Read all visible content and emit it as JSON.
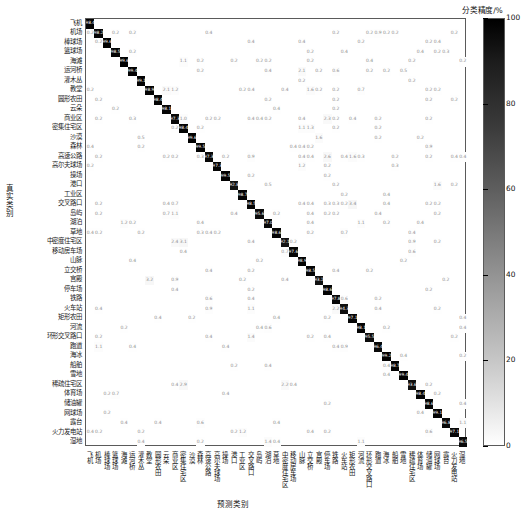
{
  "colorbar": {
    "title": "分类精度/%",
    "ticks": [
      100,
      80,
      60,
      40,
      20,
      0
    ],
    "min": 0,
    "max": 100,
    "colormap": "grayscale-inverted",
    "color_high": "#000000",
    "color_low": "#ffffff"
  },
  "axes": {
    "xlabel": "预测类别",
    "ylabel": "真实类别"
  },
  "chart_data": {
    "type": "heatmap",
    "title": "",
    "xlabel": "预测类别",
    "ylabel": "真实类别",
    "zlabel": "分类精度/%",
    "zlim": [
      0,
      100
    ],
    "grid": false,
    "legend": "colorbar-right",
    "categories": [
      "飞机",
      "机场",
      "棒球场",
      "篮球场",
      "海滩",
      "运河桥",
      "灌木丛",
      "教堂",
      "圆形农田",
      "云朵",
      "商业区",
      "密集住宅区",
      "沙漠",
      "森林",
      "高速公路",
      "高尔夫球场",
      "操场",
      "港口",
      "工业区",
      "交叉路口",
      "岛屿",
      "湖泊",
      "草地",
      "中密度住宅区",
      "移动房车场",
      "山脉",
      "立交桥",
      "宫殿",
      "停车场",
      "铁路",
      "火车站",
      "矩形农田",
      "河流",
      "环形交叉路口",
      "跑道",
      "海冰",
      "船舶",
      "雪地",
      "稀疏住宅区",
      "体育场",
      "储油罐",
      "网球场",
      "露台",
      "火力发电站",
      "湿地"
    ],
    "diagonal": [
      98.4,
      98.2,
      99.6,
      98.5,
      99.6,
      99.4,
      99.1,
      98.9,
      98.4,
      98.1,
      97.3,
      98.4,
      99.6,
      99.5,
      97.3,
      97.3,
      99.5,
      92.8,
      98.7,
      98.5,
      95.6,
      97.0,
      98.6,
      92.1,
      97.6,
      98.9,
      98.5,
      93.2,
      98.6,
      97.8,
      94.3,
      97.1,
      98.1,
      95.5,
      96.4,
      99.2,
      98.7,
      99.4,
      93.6,
      98.4,
      98.6,
      99.1,
      96.8,
      97.1,
      96.5
    ],
    "offdiagonal": [
      {
        "r": 1,
        "c": 0,
        "v": 0.2
      },
      {
        "r": 1,
        "c": 3,
        "v": 0.2
      },
      {
        "r": 1,
        "c": 5,
        "v": 0.2
      },
      {
        "r": 1,
        "c": 14,
        "v": 0.4
      },
      {
        "r": 1,
        "c": 29,
        "v": 0.2
      },
      {
        "r": 1,
        "c": 33,
        "v": 0.2
      },
      {
        "r": 1,
        "c": 34,
        "v": 0.9
      },
      {
        "r": 1,
        "c": 35,
        "v": 0.2
      },
      {
        "r": 1,
        "c": 36,
        "v": 0.2
      },
      {
        "r": 1,
        "c": 43,
        "v": 0.2
      },
      {
        "r": 2,
        "c": 1,
        "v": 0.2
      },
      {
        "r": 2,
        "c": 19,
        "v": 0.4
      },
      {
        "r": 2,
        "c": 25,
        "v": 0.4
      },
      {
        "r": 2,
        "c": 32,
        "v": 0.2
      },
      {
        "r": 2,
        "c": 40,
        "v": 0.2
      },
      {
        "r": 2,
        "c": 41,
        "v": 0.4
      },
      {
        "r": 3,
        "c": 5,
        "v": 0.2
      },
      {
        "r": 3,
        "c": 26,
        "v": 0.2
      },
      {
        "r": 3,
        "c": 30,
        "v": 0.4
      },
      {
        "r": 3,
        "c": 39,
        "v": 0.4
      },
      {
        "r": 3,
        "c": 41,
        "v": 0.2
      },
      {
        "r": 3,
        "c": 42,
        "v": 0.3
      },
      {
        "r": 4,
        "c": 11,
        "v": 1.1
      },
      {
        "r": 4,
        "c": 13,
        "v": 0.2
      },
      {
        "r": 4,
        "c": 17,
        "v": 0.2
      },
      {
        "r": 4,
        "c": 20,
        "v": 0.2
      },
      {
        "r": 4,
        "c": 21,
        "v": 0.2
      },
      {
        "r": 4,
        "c": 26,
        "v": 0.2
      },
      {
        "r": 4,
        "c": 33,
        "v": 0.4
      },
      {
        "r": 4,
        "c": 38,
        "v": 0.2
      },
      {
        "r": 4,
        "c": 44,
        "v": 0.2
      },
      {
        "r": 5,
        "c": 13,
        "v": 0.2
      },
      {
        "r": 5,
        "c": 21,
        "v": 0.4
      },
      {
        "r": 5,
        "c": 25,
        "v": 2.1
      },
      {
        "r": 5,
        "c": 27,
        "v": 0.2
      },
      {
        "r": 5,
        "c": 29,
        "v": 0.6
      },
      {
        "r": 5,
        "c": 33,
        "v": 0.2
      },
      {
        "r": 5,
        "c": 35,
        "v": 0.2
      },
      {
        "r": 5,
        "c": 37,
        "v": 0.5
      },
      {
        "r": 6,
        "c": 25,
        "v": 0.2
      },
      {
        "r": 6,
        "c": 38,
        "v": 0.2
      },
      {
        "r": 7,
        "c": 0,
        "v": 0.2
      },
      {
        "r": 7,
        "c": 9,
        "v": 2.1
      },
      {
        "r": 7,
        "c": 10,
        "v": 1.2
      },
      {
        "r": 7,
        "c": 18,
        "v": 0.2
      },
      {
        "r": 7,
        "c": 19,
        "v": 0.4
      },
      {
        "r": 7,
        "c": 23,
        "v": 0.4
      },
      {
        "r": 7,
        "c": 26,
        "v": 1.6
      },
      {
        "r": 7,
        "c": 27,
        "v": 0.2
      },
      {
        "r": 7,
        "c": 29,
        "v": 0.2
      },
      {
        "r": 7,
        "c": 32,
        "v": 0.7
      },
      {
        "r": 7,
        "c": 40,
        "v": 0.2
      },
      {
        "r": 7,
        "c": 41,
        "v": 0.2
      },
      {
        "r": 8,
        "c": 1,
        "v": 0.2
      },
      {
        "r": 8,
        "c": 21,
        "v": 0.2
      },
      {
        "r": 8,
        "c": 29,
        "v": 0.2
      },
      {
        "r": 8,
        "c": 40,
        "v": 0.2
      },
      {
        "r": 8,
        "c": 43,
        "v": 0.2
      },
      {
        "r": 9,
        "c": 3,
        "v": 0.2
      },
      {
        "r": 9,
        "c": 22,
        "v": 0.4
      },
      {
        "r": 9,
        "c": 29,
        "v": 0.2
      },
      {
        "r": 10,
        "c": 1,
        "v": 0.2
      },
      {
        "r": 10,
        "c": 5,
        "v": 0.3
      },
      {
        "r": 10,
        "c": 11,
        "v": 1.0
      },
      {
        "r": 10,
        "c": 14,
        "v": 0.2
      },
      {
        "r": 10,
        "c": 15,
        "v": 0.2
      },
      {
        "r": 10,
        "c": 19,
        "v": 0.4
      },
      {
        "r": 10,
        "c": 20,
        "v": 0.4
      },
      {
        "r": 10,
        "c": 21,
        "v": 0.2
      },
      {
        "r": 10,
        "c": 25,
        "v": 0.4
      },
      {
        "r": 10,
        "c": 28,
        "v": 2.3
      },
      {
        "r": 10,
        "c": 29,
        "v": 0.2
      },
      {
        "r": 10,
        "c": 31,
        "v": 0.4
      },
      {
        "r": 10,
        "c": 34,
        "v": 0.2
      },
      {
        "r": 10,
        "c": 40,
        "v": 0.2
      },
      {
        "r": 11,
        "c": 10,
        "v": 0.2
      },
      {
        "r": 11,
        "c": 13,
        "v": 0.2
      },
      {
        "r": 11,
        "c": 25,
        "v": 1.1
      },
      {
        "r": 11,
        "c": 26,
        "v": 1.3
      },
      {
        "r": 11,
        "c": 29,
        "v": 0.2
      },
      {
        "r": 11,
        "c": 34,
        "v": 0.2
      },
      {
        "r": 12,
        "c": 6,
        "v": 0.5
      },
      {
        "r": 12,
        "c": 27,
        "v": 1.6
      },
      {
        "r": 12,
        "c": 34,
        "v": 0.2
      },
      {
        "r": 12,
        "c": 39,
        "v": 0.2
      },
      {
        "r": 13,
        "c": 0,
        "v": 0.4
      },
      {
        "r": 13,
        "c": 6,
        "v": 0.2
      },
      {
        "r": 13,
        "c": 24,
        "v": 0.4
      },
      {
        "r": 13,
        "c": 25,
        "v": 0.4
      },
      {
        "r": 13,
        "c": 26,
        "v": 0.2
      },
      {
        "r": 13,
        "c": 40,
        "v": 0.9
      },
      {
        "r": 14,
        "c": 1,
        "v": 0.2
      },
      {
        "r": 14,
        "c": 9,
        "v": 0.2
      },
      {
        "r": 14,
        "c": 10,
        "v": 0.2
      },
      {
        "r": 14,
        "c": 13,
        "v": 0.3
      },
      {
        "r": 14,
        "c": 16,
        "v": 0.2
      },
      {
        "r": 14,
        "c": 19,
        "v": 0.9
      },
      {
        "r": 14,
        "c": 25,
        "v": 0.4
      },
      {
        "r": 14,
        "c": 26,
        "v": 0.4
      },
      {
        "r": 14,
        "c": 28,
        "v": 2.6
      },
      {
        "r": 14,
        "c": 30,
        "v": 0.4
      },
      {
        "r": 14,
        "c": 31,
        "v": 1.6
      },
      {
        "r": 14,
        "c": 32,
        "v": 0.3
      },
      {
        "r": 14,
        "c": 36,
        "v": 0.2
      },
      {
        "r": 14,
        "c": 40,
        "v": 0.2
      },
      {
        "r": 14,
        "c": 43,
        "v": 0.4
      },
      {
        "r": 14,
        "c": 44,
        "v": 0.4
      },
      {
        "r": 15,
        "c": 0,
        "v": 0.2
      },
      {
        "r": 15,
        "c": 25,
        "v": 1.2
      },
      {
        "r": 15,
        "c": 28,
        "v": 0.2
      },
      {
        "r": 15,
        "c": 36,
        "v": 0.3
      },
      {
        "r": 16,
        "c": 19,
        "v": 0.2
      },
      {
        "r": 16,
        "c": 28,
        "v": 0.2
      },
      {
        "r": 17,
        "c": 21,
        "v": 0.5
      },
      {
        "r": 17,
        "c": 29,
        "v": 0.2
      },
      {
        "r": 17,
        "c": 41,
        "v": 1.6
      },
      {
        "r": 17,
        "c": 43,
        "v": 0.2
      },
      {
        "r": 18,
        "c": 30,
        "v": 0.2
      },
      {
        "r": 18,
        "c": 35,
        "v": 0.4
      },
      {
        "r": 19,
        "c": 1,
        "v": 0.2
      },
      {
        "r": 19,
        "c": 9,
        "v": 0.4
      },
      {
        "r": 19,
        "c": 10,
        "v": 0.7
      },
      {
        "r": 19,
        "c": 25,
        "v": 0.4
      },
      {
        "r": 19,
        "c": 26,
        "v": 0.4
      },
      {
        "r": 19,
        "c": 28,
        "v": 0.3
      },
      {
        "r": 19,
        "c": 29,
        "v": 0.3
      },
      {
        "r": 19,
        "c": 30,
        "v": 0.2
      },
      {
        "r": 19,
        "c": 31,
        "v": 3.4
      },
      {
        "r": 19,
        "c": 35,
        "v": 0.4
      },
      {
        "r": 19,
        "c": 40,
        "v": 0.2
      },
      {
        "r": 19,
        "c": 41,
        "v": 0.2
      },
      {
        "r": 20,
        "c": 1,
        "v": 0.2
      },
      {
        "r": 20,
        "c": 9,
        "v": 0.7
      },
      {
        "r": 20,
        "c": 10,
        "v": 1.1
      },
      {
        "r": 20,
        "c": 17,
        "v": 0.4
      },
      {
        "r": 20,
        "c": 22,
        "v": 0.2
      },
      {
        "r": 20,
        "c": 26,
        "v": 0.4
      },
      {
        "r": 20,
        "c": 28,
        "v": 0.2
      },
      {
        "r": 20,
        "c": 29,
        "v": 0.2
      },
      {
        "r": 20,
        "c": 34,
        "v": 0.4
      },
      {
        "r": 20,
        "c": 41,
        "v": 0.2
      },
      {
        "r": 21,
        "c": 4,
        "v": 1.2
      },
      {
        "r": 21,
        "c": 5,
        "v": 0.2
      },
      {
        "r": 21,
        "c": 13,
        "v": 0.4
      },
      {
        "r": 21,
        "c": 26,
        "v": 0.4
      },
      {
        "r": 21,
        "c": 32,
        "v": 1.1
      },
      {
        "r": 21,
        "c": 35,
        "v": 0.2
      },
      {
        "r": 21,
        "c": 39,
        "v": 0.4
      },
      {
        "r": 22,
        "c": 0,
        "v": 0.4
      },
      {
        "r": 22,
        "c": 1,
        "v": 0.2
      },
      {
        "r": 22,
        "c": 6,
        "v": 0.2
      },
      {
        "r": 22,
        "c": 13,
        "v": 0.3
      },
      {
        "r": 22,
        "c": 14,
        "v": 0.4
      },
      {
        "r": 22,
        "c": 15,
        "v": 0.2
      },
      {
        "r": 22,
        "c": 26,
        "v": 0.2
      },
      {
        "r": 22,
        "c": 30,
        "v": 0.7
      },
      {
        "r": 22,
        "c": 38,
        "v": 0.4
      },
      {
        "r": 23,
        "c": 10,
        "v": 2.4
      },
      {
        "r": 23,
        "c": 11,
        "v": 3.1
      },
      {
        "r": 23,
        "c": 19,
        "v": 0.4
      },
      {
        "r": 23,
        "c": 24,
        "v": 0.2
      },
      {
        "r": 23,
        "c": 38,
        "v": 0.9
      },
      {
        "r": 23,
        "c": 41,
        "v": 0.2
      },
      {
        "r": 24,
        "c": 11,
        "v": 0.4
      },
      {
        "r": 24,
        "c": 23,
        "v": 0.7
      },
      {
        "r": 24,
        "c": 38,
        "v": 0.6
      },
      {
        "r": 25,
        "c": 5,
        "v": 0.4
      },
      {
        "r": 25,
        "c": 20,
        "v": 0.2
      },
      {
        "r": 25,
        "c": 37,
        "v": 0.2
      },
      {
        "r": 26,
        "c": 14,
        "v": 0.4
      },
      {
        "r": 26,
        "c": 19,
        "v": 0.2
      },
      {
        "r": 26,
        "c": 29,
        "v": 0.4
      },
      {
        "r": 26,
        "c": 33,
        "v": 0.2
      },
      {
        "r": 27,
        "c": 7,
        "v": 3.2
      },
      {
        "r": 27,
        "c": 10,
        "v": 0.9
      },
      {
        "r": 27,
        "c": 18,
        "v": 0.2
      },
      {
        "r": 27,
        "c": 23,
        "v": 0.4
      },
      {
        "r": 27,
        "c": 42,
        "v": 0.2
      },
      {
        "r": 28,
        "c": 10,
        "v": 0.4
      },
      {
        "r": 28,
        "c": 19,
        "v": 0.2
      },
      {
        "r": 28,
        "c": 40,
        "v": 0.2
      },
      {
        "r": 29,
        "c": 14,
        "v": 0.6
      },
      {
        "r": 29,
        "c": 19,
        "v": 0.4
      },
      {
        "r": 29,
        "c": 30,
        "v": 0.6
      },
      {
        "r": 29,
        "c": 34,
        "v": 0.2
      },
      {
        "r": 30,
        "c": 1,
        "v": 0.4
      },
      {
        "r": 30,
        "c": 14,
        "v": 0.9
      },
      {
        "r": 30,
        "c": 19,
        "v": 1.1
      },
      {
        "r": 30,
        "c": 29,
        "v": 2.2
      },
      {
        "r": 30,
        "c": 34,
        "v": 0.4
      },
      {
        "r": 30,
        "c": 41,
        "v": 0.2
      },
      {
        "r": 31,
        "c": 8,
        "v": 0.4
      },
      {
        "r": 31,
        "c": 12,
        "v": 0.2
      },
      {
        "r": 31,
        "c": 22,
        "v": 0.4
      },
      {
        "r": 31,
        "c": 28,
        "v": 0.2
      },
      {
        "r": 31,
        "c": 44,
        "v": 0.4
      },
      {
        "r": 32,
        "c": 4,
        "v": 0.2
      },
      {
        "r": 32,
        "c": 20,
        "v": 0.4
      },
      {
        "r": 32,
        "c": 21,
        "v": 0.6
      },
      {
        "r": 32,
        "c": 35,
        "v": 0.2
      },
      {
        "r": 32,
        "c": 44,
        "v": 0.4
      },
      {
        "r": 33,
        "c": 1,
        "v": 0.2
      },
      {
        "r": 33,
        "c": 14,
        "v": 0.4
      },
      {
        "r": 33,
        "c": 19,
        "v": 1.4
      },
      {
        "r": 33,
        "c": 26,
        "v": 0.2
      },
      {
        "r": 33,
        "c": 28,
        "v": 0.4
      },
      {
        "r": 33,
        "c": 43,
        "v": 0.2
      },
      {
        "r": 34,
        "c": 1,
        "v": 1.1
      },
      {
        "r": 34,
        "c": 5,
        "v": 0.4
      },
      {
        "r": 34,
        "c": 16,
        "v": 0.4
      },
      {
        "r": 34,
        "c": 29,
        "v": 0.4
      },
      {
        "r": 34,
        "c": 30,
        "v": 0.9
      },
      {
        "r": 35,
        "c": 37,
        "v": 0.4
      },
      {
        "r": 35,
        "c": 44,
        "v": 0.2
      },
      {
        "r": 36,
        "c": 17,
        "v": 0.2
      },
      {
        "r": 36,
        "c": 21,
        "v": 0.4
      },
      {
        "r": 36,
        "c": 35,
        "v": 0.4
      },
      {
        "r": 37,
        "c": 35,
        "v": 0.4
      },
      {
        "r": 38,
        "c": 10,
        "v": 0.4
      },
      {
        "r": 38,
        "c": 11,
        "v": 2.9
      },
      {
        "r": 38,
        "c": 23,
        "v": 2.2
      },
      {
        "r": 38,
        "c": 24,
        "v": 0.4
      },
      {
        "r": 38,
        "c": 40,
        "v": 0.2
      },
      {
        "r": 39,
        "c": 2,
        "v": 0.2
      },
      {
        "r": 39,
        "c": 3,
        "v": 0.7
      },
      {
        "r": 39,
        "c": 16,
        "v": 0.4
      },
      {
        "r": 39,
        "c": 41,
        "v": 0.2
      },
      {
        "r": 40,
        "c": 28,
        "v": 0.2
      },
      {
        "r": 40,
        "c": 44,
        "v": 0.4
      },
      {
        "r": 41,
        "c": 2,
        "v": 0.2
      },
      {
        "r": 41,
        "c": 39,
        "v": 0.4
      },
      {
        "r": 42,
        "c": 4,
        "v": 0.4
      },
      {
        "r": 42,
        "c": 8,
        "v": 0.4
      },
      {
        "r": 42,
        "c": 13,
        "v": 0.6
      },
      {
        "r": 42,
        "c": 22,
        "v": 0.4
      },
      {
        "r": 42,
        "c": 44,
        "v": 1.1
      },
      {
        "r": 43,
        "c": 0,
        "v": 0.4
      },
      {
        "r": 43,
        "c": 1,
        "v": 0.2
      },
      {
        "r": 43,
        "c": 6,
        "v": 0.2
      },
      {
        "r": 43,
        "c": 17,
        "v": 0.2
      },
      {
        "r": 43,
        "c": 18,
        "v": 1.2
      },
      {
        "r": 43,
        "c": 26,
        "v": 0.4
      },
      {
        "r": 43,
        "c": 28,
        "v": 0.2
      },
      {
        "r": 43,
        "c": 40,
        "v": 0.6
      },
      {
        "r": 44,
        "c": 6,
        "v": 0.4
      },
      {
        "r": 44,
        "c": 13,
        "v": 0.2
      },
      {
        "r": 44,
        "c": 21,
        "v": 1.4
      },
      {
        "r": 44,
        "c": 22,
        "v": 0.4
      },
      {
        "r": 44,
        "c": 32,
        "v": 1.1
      }
    ]
  }
}
